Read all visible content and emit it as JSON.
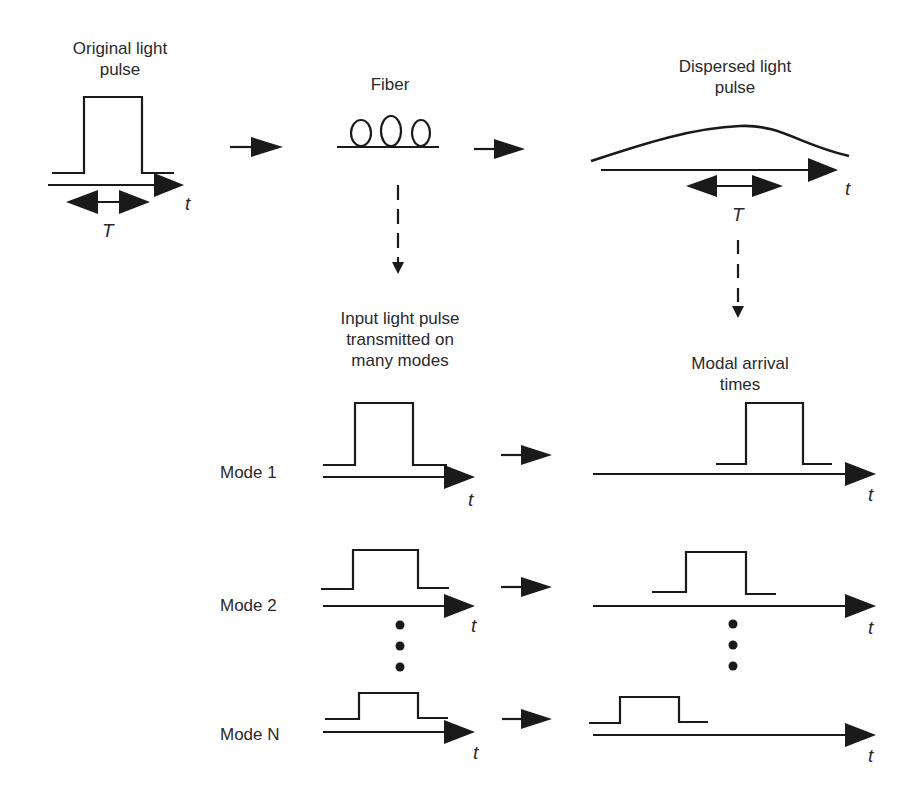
{
  "labels": {
    "original_pulse": "Original light\npulse",
    "fiber": "Fiber",
    "dispersed_pulse": "Dispersed light\npulse",
    "input_pulse_modes": "Input light pulse\ntransmitted on\nmany modes",
    "modal_arrival": "Modal arrival\ntimes",
    "time_symbol": "t",
    "period_symbol": "T"
  },
  "modes": [
    {
      "label": "Mode 1"
    },
    {
      "label": "Mode 2"
    },
    {
      "label": "Mode N"
    }
  ],
  "colors": {
    "stroke": "#1a1a1a",
    "text": "#2a2a2a",
    "background": "#ffffff"
  }
}
